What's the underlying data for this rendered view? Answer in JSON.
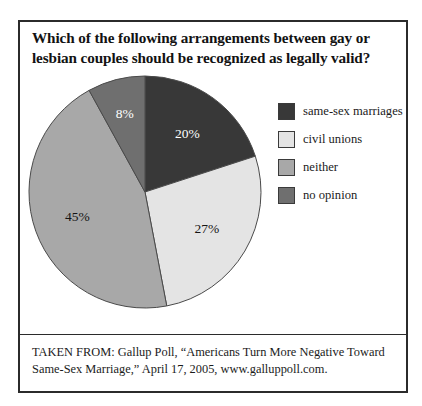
{
  "figure": {
    "title_line_1": "Which of the following arrangements between gay or",
    "title_line_2": "lesbian couples should be recognized as legally valid?",
    "source_line_1": "TAKEN FROM: Gallup Poll, “Americans Turn More Negative Toward",
    "source_line_2": "Same-Sex Marriage,” April 17, 2005, www.galluppoll.com."
  },
  "legend": {
    "items": [
      {
        "label": "same-sex marriages",
        "color": "#383838"
      },
      {
        "label": "civil unions",
        "color": "#e4e4e4"
      },
      {
        "label": "neither",
        "color": "#a8a8a8"
      },
      {
        "label": "no opinion",
        "color": "#6f6f6f"
      }
    ]
  },
  "chart_data": {
    "type": "pie",
    "title": "Which of the following arrangements between gay or lesbian couples should be recognized as legally valid?",
    "unit": "percent",
    "start_angle_deg": 0,
    "direction": "clockwise",
    "legend_position": "right",
    "categories": [
      "same-sex marriages",
      "civil unions",
      "neither",
      "no opinion"
    ],
    "values": [
      20,
      27,
      45,
      8
    ],
    "colors": [
      "#383838",
      "#e4e4e4",
      "#a8a8a8",
      "#6f6f6f"
    ],
    "slice_label_colors": [
      "#ffffff",
      "#141414",
      "#141414",
      "#ffffff"
    ],
    "data_labels": [
      "20%",
      "27%",
      "45%",
      "8%"
    ],
    "slices": [
      {
        "name": "same-sex marriages",
        "value": 20,
        "label": "20%",
        "color": "#383838",
        "label_color": "#ffffff"
      },
      {
        "name": "civil unions",
        "value": 27,
        "label": "27%",
        "color": "#e4e4e4",
        "label_color": "#141414"
      },
      {
        "name": "neither",
        "value": 45,
        "label": "45%",
        "color": "#a8a8a8",
        "label_color": "#141414"
      },
      {
        "name": "no opinion",
        "value": 8,
        "label": "8%",
        "color": "#6f6f6f",
        "label_color": "#ffffff"
      }
    ]
  }
}
